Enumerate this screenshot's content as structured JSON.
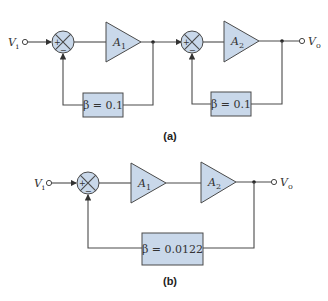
{
  "diagram": {
    "type": "feedback amplifier block diagrams",
    "part_a": {
      "caption": "(a)",
      "input_label": "V",
      "input_sub": "i",
      "output_label": "V",
      "output_sub": "o",
      "stages": [
        {
          "amp_label": "A",
          "amp_sub": "1",
          "feedback_beta": "β = 0.1",
          "sum_plus": "+",
          "sum_minus": "−"
        },
        {
          "amp_label": "A",
          "amp_sub": "2",
          "feedback_beta": "β = 0.1",
          "sum_plus": "+",
          "sum_minus": "−"
        }
      ]
    },
    "part_b": {
      "caption": "(b)",
      "input_label": "V",
      "input_sub": "i",
      "output_label": "V",
      "output_sub": "o",
      "sum_plus": "+",
      "sum_minus": "−",
      "amps": [
        {
          "amp_label": "A",
          "amp_sub": "1"
        },
        {
          "amp_label": "A",
          "amp_sub": "2"
        }
      ],
      "feedback_beta": "β = 0.0122"
    },
    "colors": {
      "block_fill": "#c9d8ea",
      "stroke": "#4a4a4a"
    }
  }
}
